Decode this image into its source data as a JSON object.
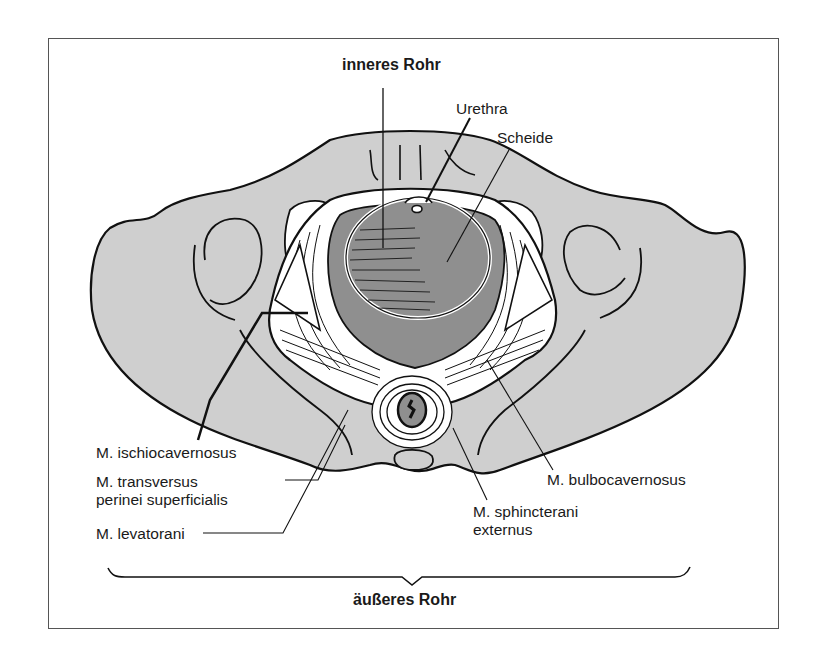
{
  "figure": {
    "title_top": "inneres Rohr",
    "title_bottom": "äußeres Rohr",
    "colors": {
      "bone": "#cfcfcf",
      "tissue_dark": "#8f8f8f",
      "muscle": "#ffffff",
      "outline": "#111111",
      "frame": "#555555"
    },
    "labels": {
      "urethra": "Urethra",
      "scheide": "Scheide",
      "ischiocavernosus": "M. ischiocavernosus",
      "transversus_1": "M. transversus",
      "transversus_2": "perinei superficialis",
      "levatorani": "M. levatorani",
      "bulbocavernosus": "M. bulbocavernosus",
      "sphincter_1": "M. sphincterani",
      "sphincter_2": "externus"
    }
  }
}
